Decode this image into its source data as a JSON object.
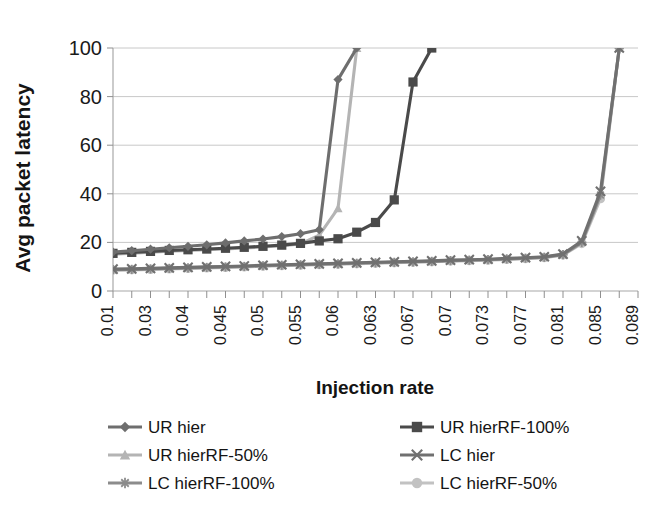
{
  "chart_data": {
    "type": "line",
    "title": "",
    "xlabel": "Injection rate",
    "ylabel": "Avg packet latency",
    "ylim": [
      0,
      100
    ],
    "yticks": [
      0,
      20,
      40,
      60,
      80,
      100
    ],
    "grid": true,
    "legend_position": "bottom",
    "x": [
      0.01,
      0.02,
      0.03,
      0.035,
      0.04,
      0.0425,
      0.045,
      0.0475,
      0.05,
      0.0525,
      0.055,
      0.0575,
      0.06,
      0.0615,
      0.063,
      0.065,
      0.067,
      0.0685,
      0.07,
      0.0715,
      0.073,
      0.075,
      0.077,
      0.079,
      0.081,
      0.083,
      0.085,
      0.087,
      0.089
    ],
    "xtick_labels": [
      "0.01",
      "0.03",
      "0.04",
      "0.045",
      "0.05",
      "0.055",
      "0.06",
      "0.063",
      "0.067",
      "0.07",
      "0.073",
      "0.077",
      "0.081",
      "0.085",
      "0.089"
    ],
    "xtick_label_indices": [
      0,
      2,
      4,
      6,
      8,
      10,
      12,
      14,
      16,
      18,
      20,
      22,
      24,
      26,
      28
    ],
    "series": [
      {
        "name": "UR hier",
        "marker": "diamond",
        "color": "#6e6e6e",
        "values": [
          16.0,
          16.6,
          17.2,
          17.8,
          18.4,
          19.0,
          19.8,
          20.6,
          21.4,
          22.4,
          23.6,
          25.2,
          87.0,
          100.0,
          null,
          null,
          null,
          null,
          null,
          null,
          null,
          null,
          null,
          null,
          null,
          null,
          null,
          null,
          null
        ]
      },
      {
        "name": "UR hierRF-100%",
        "marker": "square",
        "color": "#4a4a4a",
        "values": [
          15.5,
          15.9,
          16.3,
          16.7,
          17.0,
          17.3,
          17.6,
          18.0,
          18.4,
          18.9,
          19.6,
          20.6,
          21.5,
          24.2,
          28.2,
          37.5,
          86.0,
          100.0,
          null,
          null,
          null,
          null,
          null,
          null,
          null,
          null,
          null,
          null,
          null
        ]
      },
      {
        "name": "UR hierRF-50%",
        "marker": "triangle",
        "color": "#b4b4b4",
        "values": [
          15.2,
          15.6,
          16.0,
          16.4,
          16.7,
          17.0,
          17.3,
          17.7,
          18.1,
          18.6,
          19.4,
          23.0,
          34.0,
          100.0,
          null,
          null,
          null,
          null,
          null,
          null,
          null,
          null,
          null,
          null,
          null,
          null,
          null,
          null,
          null
        ]
      },
      {
        "name": "LC hier",
        "marker": "cross",
        "color": "#707070",
        "values": [
          9.0,
          9.1,
          9.3,
          9.5,
          9.7,
          9.9,
          10.1,
          10.3,
          10.6,
          10.8,
          11.0,
          11.2,
          11.4,
          11.6,
          11.8,
          12.0,
          12.2,
          12.4,
          12.7,
          12.9,
          13.1,
          13.4,
          13.7,
          14.1,
          15.2,
          20.6,
          41.0,
          100.0,
          null
        ]
      },
      {
        "name": "LC hierRF-100%",
        "marker": "asterisk",
        "color": "#8c8c8c",
        "values": [
          8.8,
          8.9,
          9.1,
          9.3,
          9.5,
          9.7,
          9.9,
          10.1,
          10.4,
          10.6,
          10.8,
          11.0,
          11.2,
          11.4,
          11.6,
          11.8,
          12.0,
          12.2,
          12.5,
          12.7,
          12.9,
          13.2,
          13.5,
          13.9,
          15.0,
          20.0,
          39.5,
          100.0,
          null
        ]
      },
      {
        "name": "LC hierRF-50%",
        "marker": "circle",
        "color": "#c2c2c2",
        "values": [
          8.6,
          8.7,
          8.9,
          9.1,
          9.3,
          9.5,
          9.7,
          9.9,
          10.2,
          10.4,
          10.6,
          10.8,
          11.0,
          11.2,
          11.4,
          11.6,
          11.8,
          12.0,
          12.3,
          12.5,
          12.7,
          13.0,
          13.3,
          13.7,
          14.8,
          19.5,
          38.0,
          100.0,
          null
        ]
      }
    ]
  },
  "axes": {
    "ylabel": "Avg packet latency",
    "xlabel": "Injection rate"
  },
  "legend": {
    "entries": [
      {
        "label": "UR hier",
        "marker": "diamond",
        "color": "#6e6e6e"
      },
      {
        "label": "UR hierRF-100%",
        "marker": "square",
        "color": "#4a4a4a"
      },
      {
        "label": "UR hierRF-50%",
        "marker": "triangle",
        "color": "#b4b4b4"
      },
      {
        "label": "LC hier",
        "marker": "cross",
        "color": "#707070"
      },
      {
        "label": "LC hierRF-100%",
        "marker": "asterisk",
        "color": "#8c8c8c"
      },
      {
        "label": "LC hierRF-50%",
        "marker": "circle",
        "color": "#c2c2c2"
      }
    ]
  }
}
